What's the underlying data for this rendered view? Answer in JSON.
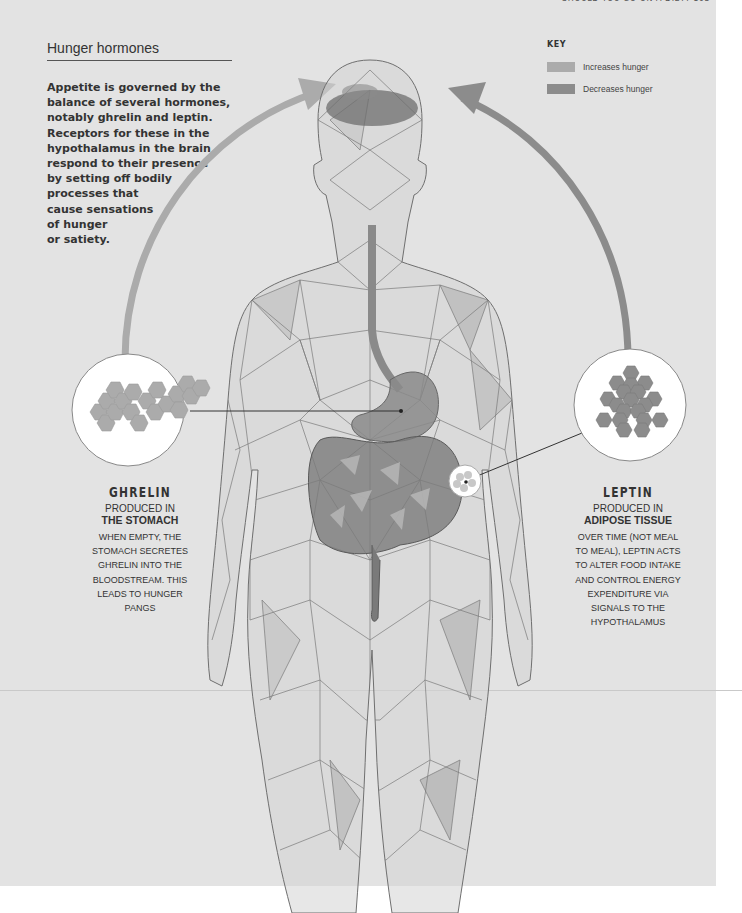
{
  "running_head": "SHOULD YOU GO ON A DIET? 163",
  "section": {
    "title": "Hunger hormones",
    "intro_lines": [
      "Appetite is governed by the",
      "balance of several hormones,",
      "notably ghrelin and leptin.",
      "Receptors for these in the",
      "hypothalamus in the brain",
      "respond to their presence",
      "by setting off bodily",
      "processes that",
      "cause sensations",
      "of hunger",
      "or satiety."
    ]
  },
  "key": {
    "title": "KEY",
    "items": [
      {
        "label": "Increases hunger",
        "color": "#ababab"
      },
      {
        "label": "Decreases hunger",
        "color": "#8c8c8c"
      }
    ]
  },
  "colors": {
    "page_bg": "#e3e3e3",
    "increases": "#ababab",
    "decreases": "#8c8c8c",
    "mesh_line": "#6f6f6f",
    "organ": "#7d7d7d"
  },
  "hormones": {
    "ghrelin": {
      "name": "GHRELIN",
      "produced_label": "PRODUCED IN",
      "source": "THE STOMACH",
      "effect": "increases",
      "desc_lines": [
        "WHEN EMPTY, THE",
        "STOMACH SECRETES",
        "GHRELIN INTO THE",
        "BLOODSTREAM. THIS",
        "LEADS TO HUNGER",
        "PANGS"
      ]
    },
    "leptin": {
      "name": "LEPTIN",
      "produced_label": "PRODUCED IN",
      "source": "ADIPOSE TISSUE",
      "effect": "decreases",
      "desc_lines": [
        "OVER TIME (NOT MEAL",
        "TO MEAL), LEPTIN ACTS",
        "TO ALTER FOOD INTAKE",
        "AND CONTROL ENERGY",
        "EXPENDITURE VIA",
        "SIGNALS TO THE",
        "HYPOTHALAMUS"
      ]
    }
  }
}
